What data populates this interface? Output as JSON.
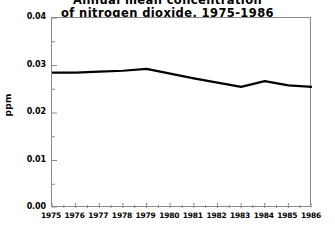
{
  "chart_data": {
    "type": "line",
    "title": "Annual mean concentration\nof nitrogen dioxide, 1975-1986",
    "title_line_1": "Annual mean concentration",
    "title_line_2": "of nitrogen dioxide, 1975-1986",
    "xlabel": "",
    "ylabel": "ppm",
    "x": [
      1975,
      1976,
      1977,
      1978,
      1979,
      1980,
      1981,
      1982,
      1983,
      1984,
      1985,
      1986
    ],
    "categories": [
      "1975",
      "1976",
      "1977",
      "1978",
      "1979",
      "1980",
      "1981",
      "1982",
      "1983",
      "1984",
      "1985",
      "1986"
    ],
    "values": [
      0.0285,
      0.0285,
      0.0287,
      0.0289,
      0.0293,
      0.0283,
      0.0273,
      0.0264,
      0.0255,
      0.0267,
      0.0258,
      0.0255
    ],
    "series": [
      {
        "name": "nitrogen dioxide",
        "values": [
          0.0285,
          0.0285,
          0.0287,
          0.0289,
          0.0293,
          0.0283,
          0.0273,
          0.0264,
          0.0255,
          0.0267,
          0.0258,
          0.0255
        ]
      }
    ],
    "xlim": [
      1975,
      1986
    ],
    "ylim": [
      0.0,
      0.04
    ],
    "ytick_labels": [
      "0.00",
      "0.01",
      "0.02",
      "0.03",
      "0.04"
    ],
    "ytick_values": [
      0.0,
      0.01,
      0.02,
      0.03,
      0.04
    ],
    "xtick_labels": [
      "1975",
      "1976",
      "1977",
      "1978",
      "1979",
      "1980",
      "1981",
      "1982",
      "1983",
      "1984",
      "1985",
      "1986"
    ],
    "grid": false,
    "legend": null,
    "line_color": "#000000",
    "line_width": 2.2,
    "frame_color": "#8a8a8a",
    "background_color": "#ffffff"
  }
}
